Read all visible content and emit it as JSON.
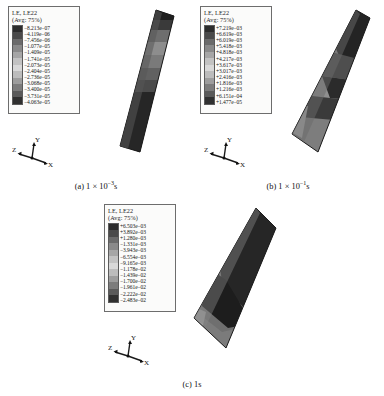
{
  "figure": {
    "variable_label": "LE, LE22",
    "avg_label": "(Avg: 75%)",
    "triad": {
      "x": "X",
      "y": "Y",
      "z": "Z"
    },
    "colors": {
      "band1": "#2c2c2c",
      "band2": "#4a4a4a",
      "band3": "#5f5f5f",
      "band4": "#787878",
      "band5": "#8e8e8e",
      "band6": "#a3a3a3",
      "band7": "#b8b8b8",
      "band8": "#cccccc",
      "band9": "#9a9a9a",
      "band10": "#6e6e6e",
      "band11": "#555555",
      "band12": "#3a3a3a",
      "outline": "#2a2a2a"
    }
  },
  "panels": [
    {
      "id": "a",
      "caption_prefix": "(a) 1 × 10",
      "caption_exponent": "−3",
      "caption_suffix": "s",
      "legend": {
        "title": "LE, LE22",
        "subtitle": "(Avg: 75%)",
        "values": [
          "−8.213e−07",
          "−4.119e−06",
          "−7.456e−06",
          "−1.077e−05",
          "−1.409e−05",
          "−1.741e−05",
          "−2.073e−05",
          "−2.404e−05",
          "−2.736e−05",
          "−3.068e−05",
          "−3.400e−05",
          "−3.731e−05",
          "−4.063e−05"
        ]
      }
    },
    {
      "id": "b",
      "caption_prefix": "(b) 1 × 10",
      "caption_exponent": "−1",
      "caption_suffix": "s",
      "legend": {
        "title": "LE, LE22",
        "subtitle": "(Avg: 75%)",
        "values": [
          "+7.219e−03",
          "+6.619e−03",
          "+6.019e−03",
          "+5.418e−03",
          "+4.818e−03",
          "+4.217e−03",
          "+3.617e−03",
          "+3.017e−03",
          "+2.416e−03",
          "+1.816e−03",
          "+1.216e−03",
          "+6.151e−04",
          "+1.477e−05"
        ]
      }
    },
    {
      "id": "c",
      "caption_prefix": "(c) 1s",
      "caption_exponent": "",
      "caption_suffix": "",
      "legend": {
        "title": "LE, LE22",
        "subtitle": "(Avg: 75%)",
        "values": [
          "+6.503e−03",
          "+3.892e−03",
          "+1.280e−03",
          "−1.331e−03",
          "−3.943e−03",
          "−6.554e−03",
          "−9.165e−03",
          "−1.178e−02",
          "−1.439e−02",
          "−1.700e−02",
          "−1.961e−02",
          "−2.222e−02",
          "−2.483e−02"
        ]
      }
    }
  ]
}
